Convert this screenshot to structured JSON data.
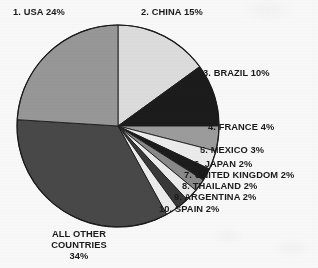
{
  "chart_data": {
    "type": "pie",
    "title": "",
    "subtitle": "",
    "xlabel": "",
    "ylabel": "",
    "legend_position": "callout-labels",
    "grid": false,
    "total_percent": 100,
    "start_angle_deg": 0,
    "direction": "clockwise",
    "categories": [
      "CHINA",
      "BRAZIL",
      "FRANCE",
      "MEXICO",
      "JAPAN",
      "UNITED KINGDOM",
      "THAILAND",
      "ARGENTINA",
      "SPAIN",
      "ALL OTHER COUNTRIES",
      "USA"
    ],
    "values": [
      15,
      10,
      4,
      3,
      2,
      2,
      2,
      2,
      2,
      34,
      24
    ],
    "slices": [
      {
        "rank": "2",
        "name": "CHINA",
        "value": 15,
        "label": "2. CHINA 15%",
        "color": "#e2e2e2",
        "start_deg": 0,
        "end_deg": 54
      },
      {
        "rank": "3",
        "name": "BRAZIL",
        "value": 10,
        "label": "3. BRAZIL 10%",
        "color": "#1c1c1c",
        "start_deg": 54,
        "end_deg": 90
      },
      {
        "rank": "4",
        "name": "FRANCE",
        "value": 4,
        "label": "4. FRANCE 4%",
        "color": "#a0a0a0",
        "start_deg": 90,
        "end_deg": 104.4
      },
      {
        "rank": "5",
        "name": "MEXICO",
        "value": 3,
        "label": "5. MEXICO 3%",
        "color": "#f2f2f2",
        "start_deg": 104.4,
        "end_deg": 115.2
      },
      {
        "rank": "6",
        "name": "JAPAN",
        "value": 2,
        "label": "6. JAPAN 2%",
        "color": "#1c1c1c",
        "start_deg": 115.2,
        "end_deg": 122.4
      },
      {
        "rank": "7",
        "name": "UNITED KINGDOM",
        "value": 2,
        "label": "7. UNITED KINGDOM 2%",
        "color": "#8d8d8d",
        "start_deg": 122.4,
        "end_deg": 129.6
      },
      {
        "rank": "8",
        "name": "THAILAND",
        "value": 2,
        "label": "8. THAILAND 2%",
        "color": "#f2f2f2",
        "start_deg": 129.6,
        "end_deg": 136.8
      },
      {
        "rank": "9",
        "name": "ARGENTINA",
        "value": 2,
        "label": "9. ARGENTINA 2%",
        "color": "#3a3a3a",
        "start_deg": 136.8,
        "end_deg": 144
      },
      {
        "rank": "10",
        "name": "SPAIN",
        "value": 2,
        "label": "10. SPAIN 2%",
        "color": "#f2f2f2",
        "start_deg": 144,
        "end_deg": 151.2
      },
      {
        "rank": "",
        "name": "ALL OTHER COUNTRIES",
        "value": 34,
        "label": "ALL OTHER COUNTRIES 34%",
        "color": "#4a4a4a",
        "start_deg": 151.2,
        "end_deg": 273.6
      },
      {
        "rank": "1",
        "name": "USA",
        "value": 24,
        "label": "1. USA 24%",
        "color": "#9b9b9b",
        "start_deg": 273.6,
        "end_deg": 360
      }
    ],
    "labels": {
      "usa": "1. USA 24%",
      "china": "2. CHINA 15%",
      "brazil": "3. BRAZIL 10%",
      "france": "4. FRANCE 4%",
      "mexico": "5. MEXICO 3%",
      "japan": "6. JAPAN 2%",
      "united_kingdom": "7. UNITED KINGDOM 2%",
      "thailand": "8. THAILAND 2%",
      "argentina": "9. ARGENTINA 2%",
      "spain": "10. SPAIN 2%",
      "all_other_line1": "ALL OTHER",
      "all_other_line2": "COUNTRIES",
      "all_other_line3": "34%"
    },
    "geometry": {
      "center_x": 118,
      "center_y": 126,
      "radius": 101
    },
    "colors": {
      "outline": "#1b1b1b",
      "text": "#1b1b1b",
      "background": "#ffffff"
    }
  }
}
